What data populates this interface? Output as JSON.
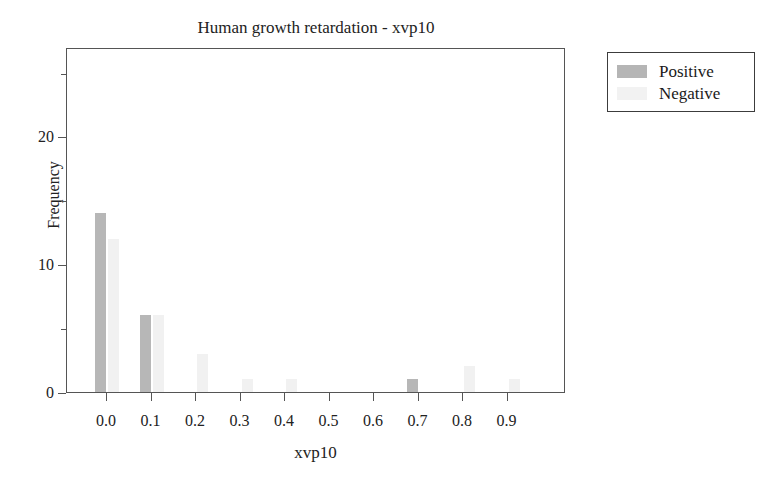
{
  "chart_data": {
    "type": "bar",
    "title": "Human growth retardation - xvp10",
    "xlabel": "xvp10",
    "ylabel": "Frequency",
    "categories": [
      "0.0",
      "0.1",
      "0.2",
      "0.3",
      "0.4",
      "0.5",
      "0.6",
      "0.7",
      "0.8",
      "0.9"
    ],
    "series": [
      {
        "name": "Positive",
        "color": "#b7b7b7",
        "values": [
          14,
          6,
          0,
          0,
          0,
          0,
          0,
          1,
          0,
          0
        ]
      },
      {
        "name": "Negative",
        "color": "#f1f1f1",
        "values": [
          12,
          6,
          3,
          1,
          1,
          0,
          0,
          0,
          2,
          1
        ]
      }
    ],
    "ylim": [
      0,
      27
    ],
    "yticks": [
      0,
      10,
      20
    ],
    "ytick_labels": [
      "0",
      "10",
      "20"
    ],
    "yticks_minor": [
      5,
      15,
      25
    ],
    "xtick_labels": [
      "0.0",
      "0.1",
      "0.2",
      "0.3",
      "0.4",
      "0.5",
      "0.6",
      "0.7",
      "0.8",
      "0.9"
    ],
    "grid": false,
    "legend_position": "outside-top-right",
    "frame": true
  },
  "legend": {
    "entries": [
      {
        "label": "Positive",
        "swatch": "positive"
      },
      {
        "label": "Negative",
        "swatch": "negative"
      }
    ]
  }
}
